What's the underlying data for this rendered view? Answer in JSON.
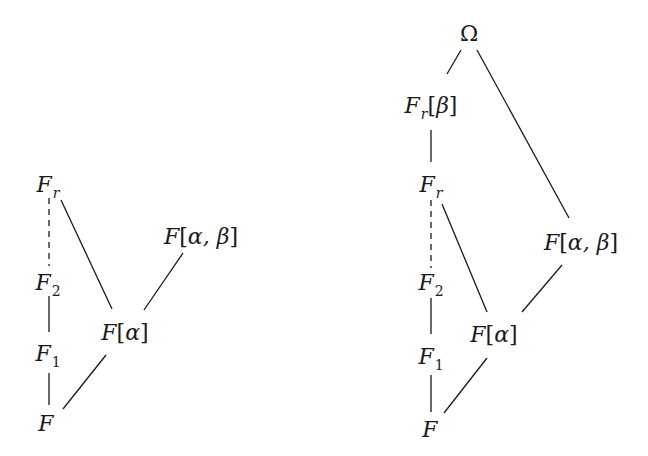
{
  "diagrams": [
    {
      "id": "left",
      "nodes": {
        "Fr": {
          "main": "F",
          "sub": "r",
          "x": 48,
          "y": 185
        },
        "F2": {
          "main": "F",
          "sub": "2",
          "x": 48,
          "y": 283
        },
        "F1": {
          "main": "F",
          "sub": "1",
          "x": 48,
          "y": 354
        },
        "F": {
          "main": "F",
          "x": 46,
          "y": 424
        },
        "Falpha": {
          "main": "F",
          "open": "[",
          "greek": "α",
          "close": "]",
          "x": 125,
          "y": 333
        },
        "Falphabeta": {
          "main": "F",
          "open": "[",
          "greek": "α, β",
          "close": "]",
          "x": 201,
          "y": 237
        }
      },
      "edges": [
        {
          "from": "Fr",
          "to": "F2",
          "style": "dashed"
        },
        {
          "from": "F2",
          "to": "F1",
          "style": "solid"
        },
        {
          "from": "F1",
          "to": "F",
          "style": "solid"
        },
        {
          "from": "Fr",
          "to": "Falpha",
          "style": "solid"
        },
        {
          "from": "Falphabeta",
          "to": "Falpha",
          "style": "solid"
        },
        {
          "from": "Falpha",
          "to": "F",
          "style": "solid"
        }
      ]
    },
    {
      "id": "right",
      "nodes": {
        "Omega": {
          "main": "Ω",
          "x": 469,
          "y": 34
        },
        "Frbeta": {
          "main": "F",
          "sub": "r",
          "open": "[",
          "greek": "β",
          "close": "]",
          "x": 431,
          "y": 106
        },
        "Fr": {
          "main": "F",
          "sub": "r",
          "x": 431,
          "y": 185
        },
        "Falphabeta": {
          "main": "F",
          "open": "[",
          "greek": "α, β",
          "close": "]",
          "x": 581,
          "y": 243
        },
        "F2": {
          "main": "F",
          "sub": "2",
          "x": 431,
          "y": 283
        },
        "Falpha": {
          "main": "F",
          "open": "[",
          "greek": "α",
          "close": "]",
          "x": 494,
          "y": 335
        },
        "F1": {
          "main": "F",
          "sub": "1",
          "x": 431,
          "y": 357
        },
        "F": {
          "main": "F",
          "x": 430,
          "y": 430
        }
      },
      "edges": [
        {
          "from": "Omega",
          "to": "Frbeta",
          "style": "solid"
        },
        {
          "from": "Omega",
          "to": "Falphabeta",
          "style": "solid"
        },
        {
          "from": "Frbeta",
          "to": "Fr",
          "style": "solid"
        },
        {
          "from": "Fr",
          "to": "F2",
          "style": "dashed"
        },
        {
          "from": "Fr",
          "to": "Falpha",
          "style": "solid"
        },
        {
          "from": "Falphabeta",
          "to": "Falpha",
          "style": "solid"
        },
        {
          "from": "F2",
          "to": "F1",
          "style": "solid"
        },
        {
          "from": "F1",
          "to": "F",
          "style": "solid"
        },
        {
          "from": "Falpha",
          "to": "F",
          "style": "solid"
        }
      ]
    }
  ],
  "labels": {
    "left_Fr": "F",
    "left_Fr_sub": "r",
    "left_F2": "F",
    "left_F2_sub": "2",
    "left_F1": "F",
    "left_F1_sub": "1",
    "left_F": "F",
    "left_Falpha": "F",
    "left_Falpha_arg": "α",
    "left_Falphabeta": "F",
    "left_Falphabeta_arg": "α, β",
    "right_Omega": "Ω",
    "right_Frbeta": "F",
    "right_Frbeta_sub": "r",
    "right_Frbeta_arg": "β",
    "right_Fr": "F",
    "right_Fr_sub": "r",
    "right_Falphabeta": "F",
    "right_Falphabeta_arg": "α, β",
    "right_F2": "F",
    "right_F2_sub": "2",
    "right_Falpha": "F",
    "right_Falpha_arg": "α",
    "right_F1": "F",
    "right_F1_sub": "1",
    "right_F": "F"
  },
  "brackets": {
    "open": "[",
    "close": "]"
  },
  "colors": {
    "ink": "#1a1a1a",
    "background": "#ffffff"
  }
}
